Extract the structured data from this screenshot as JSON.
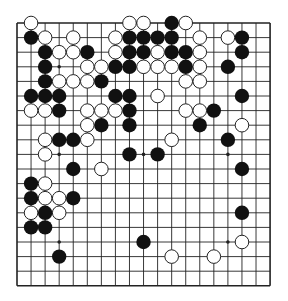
{
  "board": {
    "size": 19,
    "origin_x": 17,
    "origin_y": 23,
    "step_x": 14.06,
    "step_y": 14.6,
    "stone_radius": 7.2,
    "line_color": "#222222",
    "black_color": "#111111",
    "white_fill": "#ffffff",
    "white_stroke": "#222222",
    "star_points": [
      [
        3,
        3
      ],
      [
        9,
        3
      ],
      [
        15,
        3
      ],
      [
        3,
        9
      ],
      [
        9,
        9
      ],
      [
        15,
        9
      ],
      [
        3,
        15
      ],
      [
        9,
        15
      ],
      [
        15,
        15
      ]
    ]
  },
  "stones": {
    "black": [
      [
        11,
        0
      ],
      [
        1,
        1
      ],
      [
        8,
        1
      ],
      [
        9,
        1
      ],
      [
        10,
        1
      ],
      [
        11,
        1
      ],
      [
        16,
        1
      ],
      [
        2,
        2
      ],
      [
        5,
        2
      ],
      [
        8,
        2
      ],
      [
        9,
        2
      ],
      [
        11,
        2
      ],
      [
        12,
        2
      ],
      [
        16,
        2
      ],
      [
        2,
        3
      ],
      [
        7,
        3
      ],
      [
        8,
        3
      ],
      [
        12,
        3
      ],
      [
        15,
        3
      ],
      [
        2,
        4
      ],
      [
        6,
        4
      ],
      [
        1,
        5
      ],
      [
        2,
        5
      ],
      [
        3,
        5
      ],
      [
        7,
        5
      ],
      [
        8,
        5
      ],
      [
        16,
        5
      ],
      [
        3,
        6
      ],
      [
        8,
        6
      ],
      [
        14,
        6
      ],
      [
        6,
        7
      ],
      [
        8,
        7
      ],
      [
        13,
        7
      ],
      [
        3,
        8
      ],
      [
        4,
        8
      ],
      [
        15,
        8
      ],
      [
        8,
        9
      ],
      [
        10,
        9
      ],
      [
        4,
        10
      ],
      [
        16,
        10
      ],
      [
        1,
        11
      ],
      [
        1,
        12
      ],
      [
        4,
        12
      ],
      [
        2,
        13
      ],
      [
        16,
        13
      ],
      [
        1,
        14
      ],
      [
        2,
        14
      ],
      [
        9,
        15
      ],
      [
        3,
        16
      ]
    ],
    "white": [
      [
        1,
        0
      ],
      [
        8,
        0
      ],
      [
        9,
        0
      ],
      [
        12,
        0
      ],
      [
        2,
        1
      ],
      [
        4,
        1
      ],
      [
        7,
        1
      ],
      [
        13,
        1
      ],
      [
        15,
        1
      ],
      [
        3,
        2
      ],
      [
        4,
        2
      ],
      [
        7,
        2
      ],
      [
        10,
        2
      ],
      [
        13,
        2
      ],
      [
        5,
        3
      ],
      [
        6,
        3
      ],
      [
        9,
        3
      ],
      [
        10,
        3
      ],
      [
        11,
        3
      ],
      [
        13,
        3
      ],
      [
        3,
        4
      ],
      [
        4,
        4
      ],
      [
        5,
        4
      ],
      [
        12,
        4
      ],
      [
        13,
        4
      ],
      [
        10,
        5
      ],
      [
        1,
        6
      ],
      [
        2,
        6
      ],
      [
        5,
        6
      ],
      [
        6,
        6
      ],
      [
        7,
        6
      ],
      [
        12,
        6
      ],
      [
        13,
        6
      ],
      [
        5,
        7
      ],
      [
        16,
        7
      ],
      [
        2,
        8
      ],
      [
        5,
        8
      ],
      [
        11,
        8
      ],
      [
        2,
        9
      ],
      [
        6,
        10
      ],
      [
        2,
        11
      ],
      [
        2,
        12
      ],
      [
        3,
        12
      ],
      [
        1,
        13
      ],
      [
        3,
        13
      ],
      [
        16,
        15
      ],
      [
        11,
        16
      ],
      [
        14,
        16
      ]
    ]
  }
}
